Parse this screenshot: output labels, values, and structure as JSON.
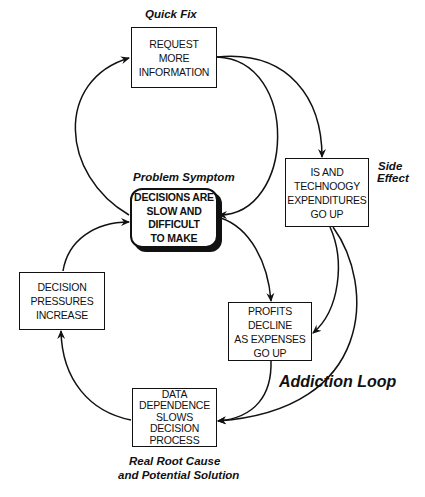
{
  "diagram": {
    "type": "causal-loop",
    "line_color": "#111111",
    "background": "#ffffff"
  },
  "labels": {
    "quick_fix": "Quick Fix",
    "problem_symptom": "Problem Symptom",
    "side_effect_line1": "Side",
    "side_effect_line2": "Effect",
    "addiction_loop": "Addiction Loop",
    "root_cause_line1": "Real Root Cause",
    "root_cause_line2": "and Potential Solution"
  },
  "nodes": {
    "request": {
      "lines": [
        "REQUEST",
        "MORE",
        "INFORMATION"
      ]
    },
    "symptom": {
      "lines": [
        "DECISIONS ARE",
        "SLOW AND",
        "DIFFICULT",
        "TO MAKE"
      ]
    },
    "expenditures": {
      "lines": [
        "IS AND",
        "TECHNOOGY",
        "EXPENDITURES",
        "GO UP"
      ]
    },
    "pressures": {
      "lines": [
        "DECISION",
        "PRESSURES",
        "INCREASE"
      ]
    },
    "profits": {
      "lines": [
        "PROFITS",
        "DECLINE",
        "AS EXPENSES",
        "GO UP"
      ]
    },
    "dependence": {
      "lines": [
        "DATA",
        "DEPENDENCE",
        "SLOWS",
        "DECISION",
        "PROCESS"
      ]
    }
  },
  "edges": [
    {
      "from": "symptom",
      "to": "request"
    },
    {
      "from": "request",
      "to": "symptom"
    },
    {
      "from": "request",
      "to": "expenditures"
    },
    {
      "from": "symptom",
      "to": "profits"
    },
    {
      "from": "expenditures",
      "to": "profits"
    },
    {
      "from": "expenditures",
      "to": "dependence"
    },
    {
      "from": "profits",
      "to": "dependence"
    },
    {
      "from": "dependence",
      "to": "pressures"
    },
    {
      "from": "pressures",
      "to": "symptom"
    }
  ]
}
